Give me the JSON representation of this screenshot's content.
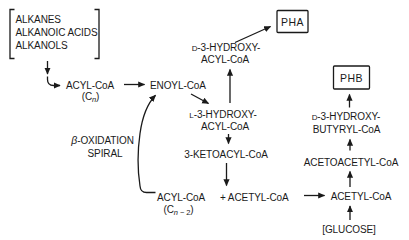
{
  "colors": {
    "ink": "#1a1a1a",
    "background": "#ffffff"
  },
  "pathway": {
    "substrates": [
      "ALKANES",
      "ALKANOIC ACIDS",
      "ALKANOLS"
    ],
    "acyl_coa_cn": {
      "label": "ACYL-CoA",
      "sub_open": "(C",
      "sub_n": "n",
      "sub_close": ")"
    },
    "enoyl_coa": {
      "label": "ENOYL-CoA"
    },
    "beta_oxidation": {
      "beta": "β",
      "line1_rest": "-OXIDATION",
      "line2": "SPIRAL"
    },
    "d3_hydroxy_acyl_coa": {
      "prefix": "D",
      "line1_rest": "-3-HYDROXY-",
      "line2": "ACYL-CoA"
    },
    "pha": {
      "label": "PHA"
    },
    "l3_hydroxy_acyl_coa": {
      "prefix": "L",
      "line1_rest": "-3-HYDROXY-",
      "line2": "ACYL-CoA"
    },
    "ketoacyl_coa": {
      "label": "3-KETOACYL-CoA"
    },
    "acyl_coa_cn2": {
      "label": "ACYL-CoA",
      "sub_open": "(C",
      "sub_n": "n",
      "sub_tail": " − 2",
      "sub_close": ")"
    },
    "plus_acetyl_coa": {
      "label": "+ ACETYL-CoA"
    },
    "acetyl_coa": {
      "label": "ACETYL-CoA"
    },
    "acetoacetyl_coa": {
      "label": "ACETOACETYL-CoA"
    },
    "d3_hydroxy_butyryl_coa": {
      "prefix": "D",
      "line1_rest": "-3-HYDROXY-",
      "line2": "BUTYRYL-CoA"
    },
    "phb": {
      "label": "PHB"
    },
    "glucose": {
      "label": "[GLUCOSE]"
    }
  }
}
